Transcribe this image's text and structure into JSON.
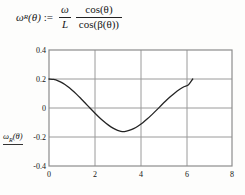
{
  "formula": {
    "lhs_symbol": "ω",
    "lhs_subscript": "R",
    "lhs_arg": "(θ)",
    "assign_operator": ":=",
    "factor_numerator": "ω",
    "factor_denominator": "L",
    "ratio_numerator": "cos(θ)",
    "ratio_denominator": "cos(β(θ))"
  },
  "axes": {
    "y_title_symbol": "ω",
    "y_title_subscript": "R",
    "y_title_arg": "(θ)",
    "x_title": "θ",
    "y_ticks": [
      "0.4",
      "0.2",
      "0",
      "-0.2",
      "-0.4"
    ],
    "y_tick_values": [
      0.4,
      0.2,
      0,
      -0.2,
      -0.4
    ],
    "x_ticks": [
      "0",
      "2",
      "4",
      "6",
      "8"
    ],
    "x_tick_values": [
      0,
      2,
      4,
      6,
      8
    ]
  },
  "colors": {
    "background": "#fdfdfc",
    "frame": "#8c8c8c",
    "grid": "#9a9a9a",
    "curve": "#242424",
    "text": "#141414"
  },
  "chart_data": {
    "type": "line",
    "title": "",
    "xlabel": "θ",
    "ylabel": "ω_R(θ)",
    "xlim": [
      0,
      8
    ],
    "ylim": [
      -0.4,
      0.4
    ],
    "grid": true,
    "legend": false,
    "xticks": [
      0,
      2,
      4,
      6,
      8
    ],
    "yticks": [
      -0.4,
      -0.2,
      0,
      0.2,
      0.4
    ],
    "series": [
      {
        "name": "ω_R(θ)",
        "x": [
          0,
          0.2,
          0.4,
          0.6,
          0.8,
          1.0,
          1.2,
          1.4,
          1.6,
          1.8,
          2.0,
          2.2,
          2.4,
          2.6,
          2.8,
          3.0,
          3.14159,
          3.3,
          3.5,
          3.7,
          3.9,
          4.1,
          4.3,
          4.5,
          4.7,
          4.9,
          5.1,
          5.3,
          5.5,
          5.7,
          5.9,
          6.1,
          6.28319
        ],
        "y": [
          0.2,
          0.1967,
          0.187,
          0.1713,
          0.1503,
          0.1247,
          0.0956,
          0.064,
          0.0312,
          -0.0019,
          -0.0343,
          -0.065,
          -0.0932,
          -0.1179,
          -0.1386,
          -0.1545,
          -0.161,
          -0.1625,
          -0.155,
          -0.142,
          -0.1239,
          -0.1012,
          -0.0748,
          -0.0456,
          -0.0147,
          0.0168,
          0.0478,
          0.0772,
          0.1041,
          0.1275,
          0.1466,
          0.161,
          0.2
        ]
      }
    ]
  }
}
